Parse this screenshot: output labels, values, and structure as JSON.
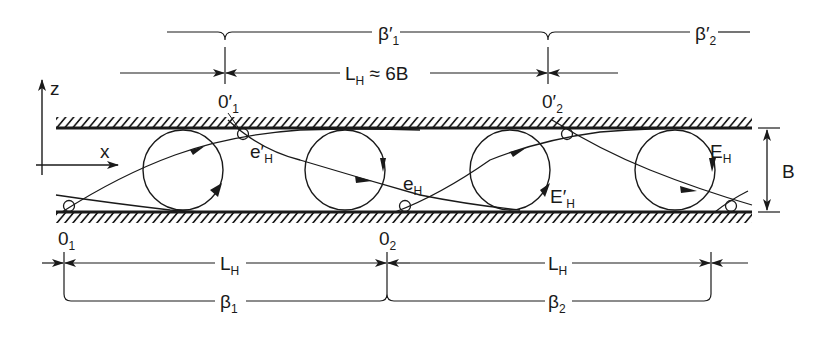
{
  "diagram": {
    "axes": {
      "z_label": "z",
      "x_label": "x"
    },
    "top_brace": {
      "labels": [
        {
          "main": "β",
          "prime": "′",
          "sub": "1"
        },
        {
          "main": "β",
          "prime": "′",
          "sub": "2"
        }
      ]
    },
    "top_dimension": {
      "main": "L",
      "sub": "H",
      "suffix": " ≈ 6B"
    },
    "top_points": [
      {
        "main": "0",
        "prime": "′",
        "sub": "1"
      },
      {
        "main": "0",
        "prime": "′",
        "sub": "2"
      }
    ],
    "bottom_points": [
      {
        "main": "0",
        "sub": "1"
      },
      {
        "main": "0",
        "sub": "2"
      }
    ],
    "bottom_dimensions": [
      {
        "main": "L",
        "sub": "H"
      },
      {
        "main": "L",
        "sub": "H"
      }
    ],
    "bottom_brace": {
      "labels": [
        {
          "main": "β",
          "sub": "1"
        },
        {
          "main": "β",
          "sub": "2"
        }
      ]
    },
    "streamline_labels": {
      "e_prime": {
        "main": "e",
        "prime": "′",
        "sub": "H"
      },
      "e": {
        "main": "e",
        "sub": "H"
      },
      "E_prime": {
        "main": "E",
        "prime": "′",
        "sub": "H"
      },
      "E": {
        "main": "E",
        "sub": "H"
      }
    },
    "gap_dimension": {
      "label": "B"
    },
    "colors": {
      "ink": "#1a1a1a",
      "background": "#ffffff"
    }
  }
}
